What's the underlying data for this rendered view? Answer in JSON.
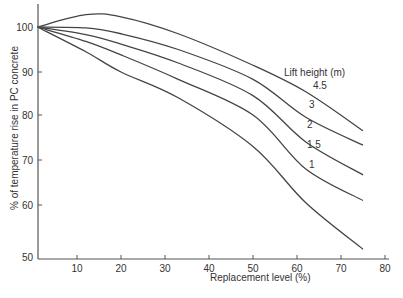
{
  "chart_data": {
    "type": "line",
    "title": "",
    "xlabel": "Replacement level (%)",
    "ylabel": "% of temperature rise in PC concrete",
    "xlim": [
      0,
      80
    ],
    "ylim": [
      50,
      105
    ],
    "xticks": [
      10,
      20,
      30,
      40,
      50,
      60,
      70,
      80
    ],
    "yticks": [
      50,
      60,
      70,
      80,
      90,
      100
    ],
    "grid": false,
    "legend_title": "Lift height (m)",
    "legend_position": "inline labels near right end of curves",
    "x": [
      1,
      12,
      20,
      33,
      50,
      62,
      75
    ],
    "series": [
      {
        "name": "4.5",
        "values": [
          100,
          102.8,
          102.3,
          98.5,
          91.5,
          85.4,
          76.5
        ]
      },
      {
        "name": "3",
        "values": [
          100,
          99.8,
          98.5,
          95,
          88.3,
          79.5,
          73.3
        ]
      },
      {
        "name": "2",
        "values": [
          100,
          98.3,
          96.2,
          92,
          84.5,
          74,
          66.7
        ]
      },
      {
        "name": "1.5",
        "values": [
          100,
          96.8,
          93.8,
          88.3,
          80,
          68,
          61
        ]
      },
      {
        "name": "1",
        "values": [
          100,
          94.5,
          90,
          84,
          73,
          60.5,
          51.5
        ]
      }
    ]
  },
  "labels": {
    "legend_title": "Lift height (m)",
    "xlabel": "Replacement level (%)",
    "ylabel": "% of temperature rise in PC concrete"
  }
}
